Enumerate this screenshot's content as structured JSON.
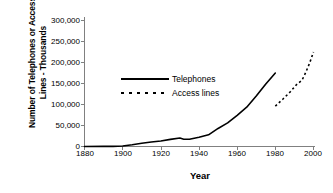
{
  "chart_data": {
    "type": "line",
    "title": "",
    "xlabel": "Year",
    "ylabel": "Number of Telephones or Access\nLines - Thousands",
    "ylabel_line1": "Number of Telephones or Access",
    "ylabel_line2": "Lines - Thousands",
    "xlim": [
      1880,
      2000
    ],
    "ylim": [
      0,
      300000
    ],
    "grid": false,
    "legend_position": "inside-upper-left",
    "xticks": [
      1880,
      1900,
      1920,
      1940,
      1960,
      1980,
      2000
    ],
    "xtick_labels": [
      "1880",
      "1900",
      "1920",
      "1940",
      "1960",
      "1980",
      "2000"
    ],
    "yticks": [
      0,
      50000,
      100000,
      150000,
      200000,
      250000,
      300000
    ],
    "ytick_labels": [
      "0",
      "50,000",
      "100,000",
      "150,000",
      "200,000",
      "250,000",
      "300,000"
    ],
    "series": [
      {
        "name": "Telephones",
        "style": "solid",
        "color": "#000000",
        "x": [
          1880,
          1890,
          1895,
          1900,
          1905,
          1910,
          1915,
          1920,
          1925,
          1930,
          1932,
          1935,
          1940,
          1945,
          1950,
          1955,
          1960,
          1965,
          1970,
          1975,
          1980
        ],
        "values": [
          0,
          230,
          340,
          1356,
          4127,
          7635,
          10524,
          13273,
          16875,
          20103,
          17424,
          17424,
          21928,
          27867,
          43004,
          56243,
          74342,
          93656,
          120218,
          149011,
          175000
        ]
      },
      {
        "name": "Access lines",
        "style": "dashed",
        "color": "#000000",
        "x": [
          1980,
          1984,
          1988,
          1991,
          1994,
          1996,
          1998,
          2000
        ],
        "values": [
          96000,
          113000,
          131000,
          147000,
          158000,
          177000,
          199000,
          225000
        ]
      }
    ],
    "legend": [
      {
        "label": "Telephones",
        "style": "solid"
      },
      {
        "label": "Access lines",
        "style": "dashed"
      }
    ]
  }
}
